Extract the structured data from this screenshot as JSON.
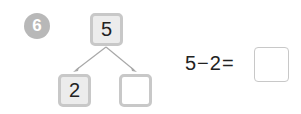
{
  "problem": {
    "number": "6",
    "bond": {
      "whole": "5",
      "part_left": "2",
      "part_right": ""
    },
    "equation": "5−2=",
    "answer": ""
  },
  "colors": {
    "circle": "#b8b8b8",
    "box_border": "#c8c8c8",
    "box_fill": "#ececec"
  }
}
